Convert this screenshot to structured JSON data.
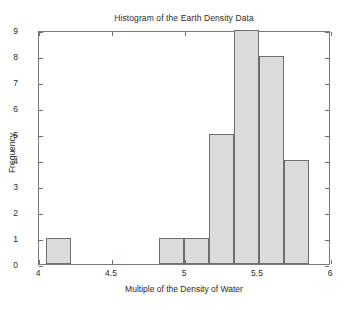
{
  "chart_data": {
    "type": "bar",
    "title": "Histogram of the Earth Density Data",
    "xlabel": "Multiple of the Density of Water",
    "ylabel": "Frequency",
    "xlim": [
      4,
      6
    ],
    "ylim": [
      0,
      9
    ],
    "grid": false,
    "legend": null,
    "xticks": [
      4,
      4.5,
      5,
      5.5,
      6
    ],
    "xtick_labels": [
      "4",
      "4.5",
      "5",
      "5.5",
      "6"
    ],
    "yticks": [
      0,
      1,
      2,
      3,
      4,
      5,
      6,
      7,
      8,
      9
    ],
    "ytick_labels": [
      "0",
      "1",
      "2",
      "3",
      "4",
      "5",
      "6",
      "7",
      "8",
      "9"
    ],
    "bin_width": 0.1717,
    "bars": [
      {
        "bin_start": 4.05,
        "bin_end": 4.2217,
        "value": 1
      },
      {
        "bin_start": 4.8217,
        "bin_end": 4.9934,
        "value": 1
      },
      {
        "bin_start": 4.9934,
        "bin_end": 5.1651,
        "value": 1
      },
      {
        "bin_start": 5.1651,
        "bin_end": 5.3368,
        "value": 5
      },
      {
        "bin_start": 5.3368,
        "bin_end": 5.5085,
        "value": 9
      },
      {
        "bin_start": 5.5085,
        "bin_end": 5.6802,
        "value": 8
      },
      {
        "bin_start": 5.6802,
        "bin_end": 5.8519,
        "value": 4
      }
    ],
    "colors": {
      "bar_fill": "#dcdcdc",
      "bar_edge": "#6e6e6e",
      "axis": "#7a7a7a",
      "text": "#2b2b2b",
      "background": "#ffffff"
    }
  }
}
